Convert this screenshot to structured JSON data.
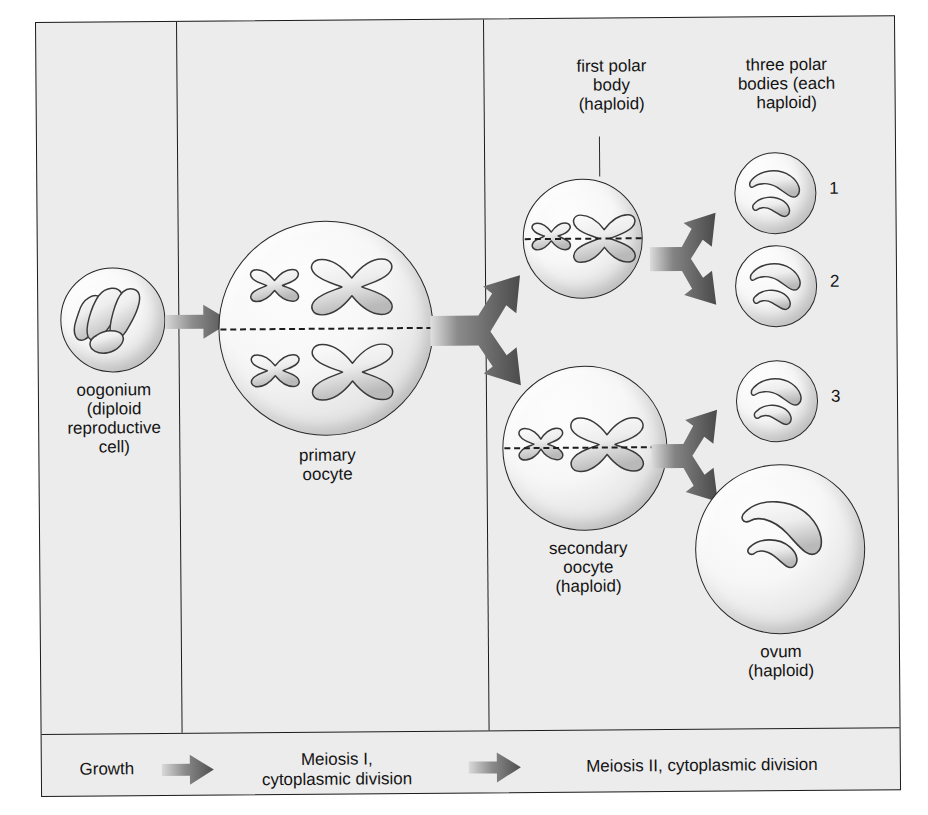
{
  "figure": {
    "background_color": "#ececec",
    "border_color": "#1c1c1c",
    "arrow_color": "#4a4a4a"
  },
  "top_labels": [
    {
      "name": "first-polar-body",
      "text": "first polar\nbody\n(haploid)"
    },
    {
      "name": "three-polar-bodies",
      "text": "three polar\nbodies (each\nhaploid)"
    }
  ],
  "cells": [
    {
      "name": "oogonium",
      "label": "oogonium\n(diploid\nreproductive\ncell)",
      "ploidy": "diploid",
      "chromosome_count": 4,
      "chromosome_form": "elongated"
    },
    {
      "name": "primary-oocyte",
      "label": "primary\noocyte",
      "ploidy": "diploid",
      "chromosome_count": 4,
      "chromosome_form": "tetrad"
    },
    {
      "name": "first-polar-body",
      "label": "",
      "ploidy": "haploid",
      "chromosome_count": 2,
      "chromosome_form": "tetrad"
    },
    {
      "name": "secondary-oocyte",
      "label": "secondary\noocyte\n(haploid)",
      "ploidy": "haploid",
      "chromosome_count": 2,
      "chromosome_form": "tetrad"
    },
    {
      "name": "polar-body-1",
      "label": "1",
      "ploidy": "haploid",
      "chromosome_count": 2,
      "chromosome_form": "curved"
    },
    {
      "name": "polar-body-2",
      "label": "2",
      "ploidy": "haploid",
      "chromosome_count": 2,
      "chromosome_form": "curved"
    },
    {
      "name": "polar-body-3",
      "label": "3",
      "ploidy": "haploid",
      "chromosome_count": 2,
      "chromosome_form": "curved"
    },
    {
      "name": "ovum",
      "label": "ovum\n(haploid)",
      "ploidy": "haploid",
      "chromosome_count": 2,
      "chromosome_form": "curved"
    }
  ],
  "numbers": {
    "polar_body_1": "1",
    "polar_body_2": "2",
    "polar_body_3": "3"
  },
  "caption": {
    "stages": [
      {
        "name": "growth",
        "text": "Growth"
      },
      {
        "name": "meiosis-i",
        "text": "Meiosis I,\ncytoplasmic division"
      },
      {
        "name": "meiosis-ii",
        "text": "Meiosis II, cytoplasmic division"
      }
    ]
  },
  "icons": {
    "arrow_right": "arrow-right-icon",
    "arrow_split": "arrow-split-icon"
  }
}
